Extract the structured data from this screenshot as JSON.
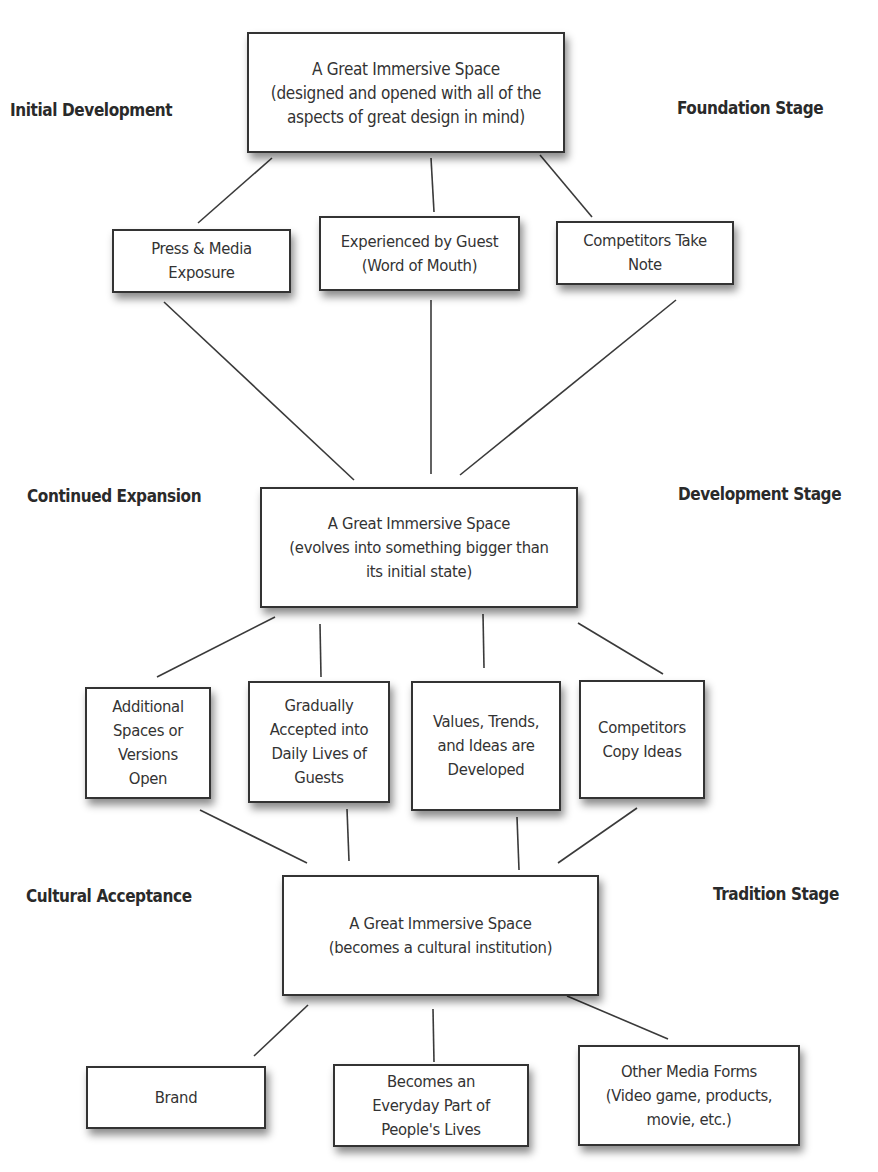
{
  "stages": {
    "foundation": {
      "left_label": "Initial Development",
      "right_label": "Foundation Stage"
    },
    "development": {
      "left_label": "Continued Expansion",
      "right_label": "Development Stage"
    },
    "tradition": {
      "left_label": "Cultural Acceptance",
      "right_label": "Tradition Stage"
    }
  },
  "nodes": {
    "foundation_main": "A Great Immersive Space\n(designed and opened with all of the\naspects of great design in mind)",
    "press_media": "Press & Media\nExposure",
    "experienced_guest": "Experienced by Guest\n(Word of Mouth)",
    "competitors_note": "Competitors Take\nNote",
    "development_main": "A Great Immersive Space\n(evolves into something bigger than\nits initial state)",
    "additional_spaces": "Additional\nSpaces or\nVersions\nOpen",
    "gradually_accepted": "Gradually\nAccepted into\nDaily Lives of\nGuests",
    "values_trends": "Values, Trends,\nand Ideas are\nDeveloped",
    "competitors_copy": "Competitors\nCopy Ideas",
    "tradition_main": "A Great Immersive Space\n(becomes a cultural institution)",
    "brand": "Brand",
    "everyday_part": "Becomes an\nEveryday Part of\nPeople's Lives",
    "other_media": "Other Media Forms\n(Video game, products,\nmovie, etc.)"
  },
  "edges": [
    [
      "foundation_main",
      "press_media"
    ],
    [
      "foundation_main",
      "experienced_guest"
    ],
    [
      "foundation_main",
      "competitors_note"
    ],
    [
      "press_media",
      "development_main"
    ],
    [
      "experienced_guest",
      "development_main"
    ],
    [
      "competitors_note",
      "development_main"
    ],
    [
      "development_main",
      "additional_spaces"
    ],
    [
      "development_main",
      "gradually_accepted"
    ],
    [
      "development_main",
      "values_trends"
    ],
    [
      "development_main",
      "competitors_copy"
    ],
    [
      "additional_spaces",
      "tradition_main"
    ],
    [
      "gradually_accepted",
      "tradition_main"
    ],
    [
      "values_trends",
      "tradition_main"
    ],
    [
      "competitors_copy",
      "tradition_main"
    ],
    [
      "tradition_main",
      "brand"
    ],
    [
      "tradition_main",
      "everyday_part"
    ],
    [
      "tradition_main",
      "other_media"
    ]
  ]
}
